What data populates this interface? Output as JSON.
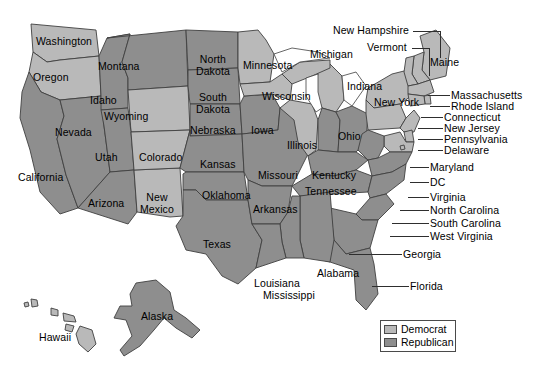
{
  "map": {
    "title": "United States political party map by state",
    "background_color": "#ffffff",
    "border_color": "#3f3f3f",
    "democrat_color": "#b9b9b9",
    "republican_color": "#8e8e8e",
    "lake_color": "#ffffff"
  },
  "legend": {
    "items": [
      {
        "label": "Democrat",
        "color": "#b9b9b9"
      },
      {
        "label": "Republican",
        "color": "#8e8e8e"
      }
    ]
  },
  "inline_labels": [
    {
      "name": "washington",
      "text": "Washington",
      "party": "Democrat",
      "x": 36,
      "y": 36
    },
    {
      "name": "oregon",
      "text": "Oregon",
      "party": "Democrat",
      "x": 33,
      "y": 72
    },
    {
      "name": "california",
      "text": "California",
      "party": "Republican",
      "x": 18,
      "y": 172
    },
    {
      "name": "nevada",
      "text": "Nevada",
      "party": "Republican",
      "x": 55,
      "y": 127
    },
    {
      "name": "idaho",
      "text": "Idaho",
      "party": "Republican",
      "x": 90,
      "y": 95
    },
    {
      "name": "montana",
      "text": "Montana",
      "party": "Republican",
      "x": 98,
      "y": 61
    },
    {
      "name": "wyoming",
      "text": "Wyoming",
      "party": "Democrat",
      "x": 104,
      "y": 111
    },
    {
      "name": "utah",
      "text": "Utah",
      "party": "Republican",
      "x": 95,
      "y": 152
    },
    {
      "name": "arizona",
      "text": "Arizona",
      "party": "Republican",
      "x": 88,
      "y": 198
    },
    {
      "name": "new-mexico",
      "text": "New\nMexico",
      "party": "Democrat",
      "x": 140,
      "y": 192
    },
    {
      "name": "colorado",
      "text": "Colorado",
      "party": "Democrat",
      "x": 139,
      "y": 152
    },
    {
      "name": "north-dakota",
      "text": "North\nDakota",
      "party": "Republican",
      "x": 196,
      "y": 54
    },
    {
      "name": "south-dakota",
      "text": "South\nDakota",
      "party": "Republican",
      "x": 196,
      "y": 92
    },
    {
      "name": "nebraska",
      "text": "Nebraska",
      "party": "Republican",
      "x": 190,
      "y": 125
    },
    {
      "name": "kansas",
      "text": "Kansas",
      "party": "Republican",
      "x": 200,
      "y": 159
    },
    {
      "name": "oklahoma",
      "text": "Oklahoma",
      "party": "Republican",
      "x": 202,
      "y": 190
    },
    {
      "name": "texas",
      "text": "Texas",
      "party": "Republican",
      "x": 203,
      "y": 239
    },
    {
      "name": "minnesota",
      "text": "Minnesota",
      "party": "Democrat",
      "x": 243,
      "y": 60
    },
    {
      "name": "iowa",
      "text": "Iowa",
      "party": "Republican",
      "x": 251,
      "y": 125
    },
    {
      "name": "wisconsin",
      "text": "Wisconsin",
      "party": "Democrat",
      "x": 262,
      "y": 91
    },
    {
      "name": "missouri",
      "text": "Missouri",
      "party": "Republican",
      "x": 258,
      "y": 170
    },
    {
      "name": "arkansas",
      "text": "Arkansas",
      "party": "Republican",
      "x": 253,
      "y": 204
    },
    {
      "name": "illinois",
      "text": "Illinois",
      "party": "Democrat",
      "x": 287,
      "y": 140
    },
    {
      "name": "michigan",
      "text": "Michigan",
      "party": "Democrat",
      "x": 310,
      "y": 49
    },
    {
      "name": "indiana",
      "text": "Indiana",
      "party": "Republican",
      "x": 347,
      "y": 81
    },
    {
      "name": "ohio",
      "text": "Ohio",
      "party": "Republican",
      "x": 338,
      "y": 131
    },
    {
      "name": "kentucky",
      "text": "Kentucky",
      "party": "Republican",
      "x": 312,
      "y": 170
    },
    {
      "name": "tennessee",
      "text": "Tennessee",
      "party": "Republican",
      "x": 305,
      "y": 186
    },
    {
      "name": "new-york",
      "text": "New York",
      "party": "Democrat",
      "x": 374,
      "y": 97
    },
    {
      "name": "maine",
      "text": "Maine",
      "party": "Democrat",
      "x": 430,
      "y": 57
    },
    {
      "name": "louisiana",
      "text": "Louisiana",
      "party": "Republican",
      "x": 254,
      "y": 278
    },
    {
      "name": "mississippi",
      "text": "Mississippi",
      "party": "Republican",
      "x": 263,
      "y": 290
    },
    {
      "name": "alabama",
      "text": "Alabama",
      "party": "Republican",
      "x": 317,
      "y": 268
    },
    {
      "name": "alaska",
      "text": "Alaska",
      "party": "Republican",
      "x": 141,
      "y": 311
    },
    {
      "name": "hawaii",
      "text": "Hawaii",
      "party": "Democrat",
      "x": 39,
      "y": 332
    }
  ],
  "callout_labels": [
    {
      "name": "new-hampshire",
      "text": "New Hampshire",
      "party": "Democrat",
      "x": 333,
      "y": 25,
      "line_x": 413,
      "line_y": 31,
      "line_w": 27,
      "drop_y": 31,
      "drop_h": 27
    },
    {
      "name": "vermont",
      "text": "Vermont",
      "party": "Democrat",
      "x": 367,
      "y": 42,
      "line_x": 412,
      "line_y": 48,
      "line_w": 17,
      "drop_y": 48,
      "drop_h": 28
    },
    {
      "name": "massachusetts",
      "text": "Massachusetts",
      "party": "Democrat",
      "x": 451,
      "y": 90,
      "line_x": 428,
      "line_y": 95,
      "line_w": 22
    },
    {
      "name": "rhode-island",
      "text": "Rhode Island",
      "party": "Democrat",
      "x": 451,
      "y": 101,
      "line_x": 430,
      "line_y": 106,
      "line_w": 20
    },
    {
      "name": "connecticut",
      "text": "Connecticut",
      "party": "Democrat",
      "x": 444,
      "y": 112,
      "line_x": 421,
      "line_y": 117,
      "line_w": 22
    },
    {
      "name": "new-jersey",
      "text": "New Jersey",
      "party": "Democrat",
      "x": 444,
      "y": 123,
      "line_x": 418,
      "line_y": 128,
      "line_w": 25
    },
    {
      "name": "pennsylvania",
      "text": "Pennsylvania",
      "party": "Democrat",
      "x": 444,
      "y": 134,
      "line_x": 418,
      "line_y": 139,
      "line_w": 25
    },
    {
      "name": "delaware",
      "text": "Delaware",
      "party": "Democrat",
      "x": 444,
      "y": 145,
      "line_x": 418,
      "line_y": 150,
      "line_w": 25
    },
    {
      "name": "maryland",
      "text": "Maryland",
      "party": "Democrat",
      "x": 430,
      "y": 162,
      "line_x": 410,
      "line_y": 167,
      "line_w": 19
    },
    {
      "name": "dc",
      "text": "DC",
      "party": "Democrat",
      "x": 430,
      "y": 177,
      "line_x": 410,
      "line_y": 182,
      "line_w": 19
    },
    {
      "name": "virginia",
      "text": "Virginia",
      "party": "Republican",
      "x": 430,
      "y": 192,
      "line_x": 408,
      "line_y": 197,
      "line_w": 21
    },
    {
      "name": "north-carolina",
      "text": "North Carolina",
      "party": "Republican",
      "x": 430,
      "y": 205,
      "line_x": 400,
      "line_y": 210,
      "line_w": 29
    },
    {
      "name": "south-carolina",
      "text": "South Carolina",
      "party": "Republican",
      "x": 430,
      "y": 218,
      "line_x": 392,
      "line_y": 223,
      "line_w": 37
    },
    {
      "name": "west-virginia",
      "text": "West Virginia",
      "party": "Republican",
      "x": 430,
      "y": 231,
      "line_x": 390,
      "line_y": 236,
      "line_w": 39
    },
    {
      "name": "georgia",
      "text": "Georgia",
      "party": "Republican",
      "x": 403,
      "y": 249,
      "line_x": 349,
      "line_y": 254,
      "line_w": 53
    },
    {
      "name": "florida",
      "text": "Florida",
      "party": "Republican",
      "x": 410,
      "y": 281,
      "line_x": 372,
      "line_y": 286,
      "line_w": 37
    }
  ]
}
